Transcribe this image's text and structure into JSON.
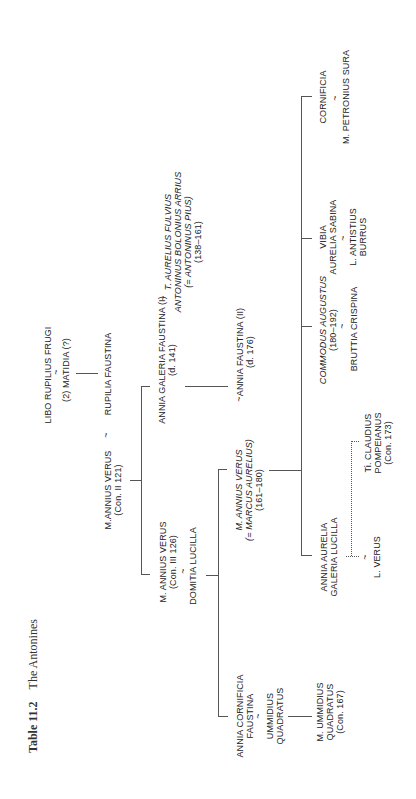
{
  "title": {
    "number": "Table 11.2",
    "text": "The Antonines"
  },
  "orientation": "rotated -90deg (text reads bottom-to-top)",
  "marriage_symbol": "~",
  "nodes": {
    "libo": {
      "lines": [
        "LIBO RUPILIUS FRUGI"
      ]
    },
    "matidia": {
      "lines": [
        "(2) MATIDIA (?)"
      ]
    },
    "rupilia": {
      "lines": [
        "RUPILIA FAUSTINA"
      ]
    },
    "annius_verus_2": {
      "lines": [
        "M.ANNIUS VERUS",
        "(Con. II 121)"
      ]
    },
    "faustina_1": {
      "lines": [
        "ANNIA GALERIA FAUSTINA (I)",
        "(d. 141)"
      ]
    },
    "antoninus": {
      "lines": [
        "T. AURELIUS FULVIUS",
        "ANTONINUS BOLONIUS ARRIUS",
        "(= ANTONINUS PIUS)",
        "(138–161)"
      ]
    },
    "annius_verus_3": {
      "lines": [
        "M. ANNIUS VERUS",
        "(Con. III 126)"
      ]
    },
    "domitia": {
      "lines": [
        "DOMITIA LUCILLA"
      ]
    },
    "marcus": {
      "lines": [
        "M. ANNIUS VERUS",
        "(= MARCUS AURELIUS)",
        "(161–180)"
      ]
    },
    "faustina_2": {
      "lines": [
        "ANNIA FAUSTINA (II)",
        "(d. 176)"
      ]
    },
    "cornificia_faustina": {
      "lines": [
        "ANNIA CORNIFICIA",
        "FAUSTINA"
      ]
    },
    "ummidius": {
      "lines": [
        "UMMIDIUS",
        "QUADRATUS"
      ]
    },
    "m_ummidius": {
      "lines": [
        "M. UMMIDIUS",
        "QUADRATUS",
        "(Con. 167)"
      ]
    },
    "lucilla": {
      "lines": [
        "ANNIA AURELIA",
        "GALERIA LUCILLA"
      ]
    },
    "l_verus": {
      "lines": [
        "L. VERUS"
      ]
    },
    "pompeianus": {
      "lines": [
        "Ti. CLAUDIUS",
        "POMPEIANUS",
        "(Con. 173)"
      ]
    },
    "commodus": {
      "lines": [
        "COMMODUS AUGUSTUS",
        "(180–192)"
      ]
    },
    "bruttia": {
      "lines": [
        "BRUTTIA CRISPINA"
      ]
    },
    "vibia": {
      "lines": [
        "VIBIA",
        "AURELIA SABINA"
      ]
    },
    "burrus": {
      "lines": [
        "L. ANTISTIUS",
        "BURRUS"
      ]
    },
    "cornificia": {
      "lines": [
        "CORNIFICIA"
      ]
    },
    "petronius": {
      "lines": [
        "M. PETRONIUS SURA"
      ]
    }
  }
}
